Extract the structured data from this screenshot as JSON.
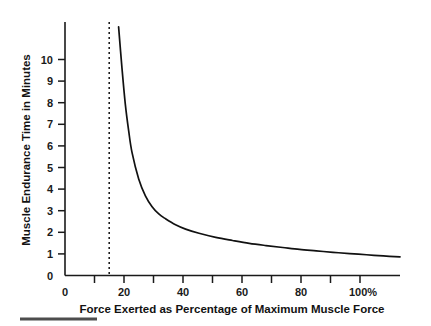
{
  "chart_data": {
    "type": "line",
    "title": "",
    "subtitle": "",
    "xlabel": "Force Exerted as Percentage of Maximum Muscle Force",
    "ylabel": "Muscle Endurance Time in Minutes",
    "xlim": [
      0,
      100
    ],
    "ylim": [
      0,
      10.5
    ],
    "grid": false,
    "legend": "none",
    "x_tick_values": [
      0,
      10,
      20,
      30,
      40,
      50,
      60,
      70,
      80,
      90,
      100
    ],
    "x_tick_labels": [
      "0",
      "",
      "20",
      "",
      "40",
      "",
      "60",
      "",
      "80",
      "",
      "100%"
    ],
    "y_tick_values": [
      0,
      1,
      2,
      3,
      4,
      5,
      6,
      7,
      8,
      9,
      10
    ],
    "y_tick_labels": [
      "0",
      "1",
      "2",
      "3",
      "4",
      "5",
      "6",
      "7",
      "8",
      "9",
      "10"
    ],
    "series": [
      {
        "name": "Endurance time",
        "x": [
          16,
          17,
          18,
          19,
          20,
          22,
          24,
          26,
          28,
          30,
          33,
          36,
          40,
          45,
          50,
          55,
          60,
          65,
          70,
          75,
          80,
          85,
          90,
          95,
          100
        ],
        "values": [
          10.3,
          8.6,
          7.1,
          6.0,
          5.1,
          4.0,
          3.3,
          2.85,
          2.55,
          2.35,
          2.1,
          1.92,
          1.75,
          1.58,
          1.45,
          1.33,
          1.24,
          1.16,
          1.08,
          1.02,
          0.96,
          0.91,
          0.86,
          0.81,
          0.77
        ]
      }
    ],
    "annotations": [
      {
        "name": "threshold-line",
        "type": "vertical-dashed-line",
        "x": 15,
        "label": ""
      }
    ]
  },
  "axis": {
    "x_label": "Force Exerted as Percentage of Maximum Muscle Force",
    "y_label": "Muscle Endurance Time in Minutes"
  },
  "ticks": {
    "y": [
      "10",
      "9",
      "8",
      "7",
      "6",
      "5",
      "4",
      "3",
      "2",
      "1",
      "0"
    ],
    "x": [
      "0",
      "20",
      "40",
      "60",
      "80",
      "100%"
    ]
  },
  "colors": {
    "curve": "#111111",
    "axis": "#1a1a1a",
    "threshold": "#111111",
    "text": "#121212",
    "background": "#ffffff",
    "footer_rule": "#4d4d4d"
  }
}
